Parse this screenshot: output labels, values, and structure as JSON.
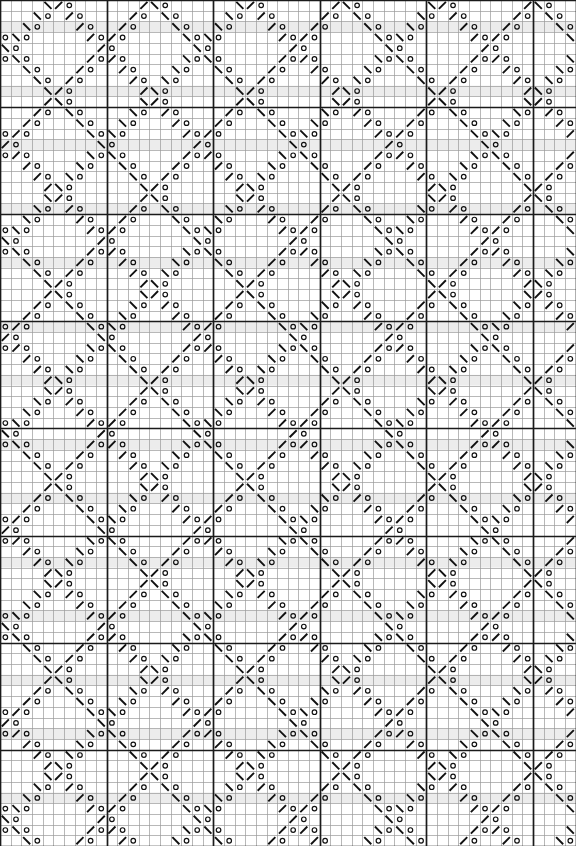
{
  "chart_meta": {
    "title": "Lace Knitting Chart",
    "kind": "knitting-lace-chart",
    "width_px": 576,
    "height_px": 846,
    "columns": 54,
    "rows": 79,
    "cell_w": 10.66,
    "cell_h": 10.71,
    "heavy_every": 10,
    "colors": {
      "background": "#ffffff",
      "grid_light": "#9a9a9a",
      "grid_heavy": "#1a1a1a",
      "symbol": "#101010",
      "shade_band": "#ececec"
    },
    "line_widths": {
      "light": 0.7,
      "heavy": 1.7,
      "symbol": 1.9
    }
  },
  "legend": {
    "title": "Symbols",
    "items": [
      {
        "key": "o",
        "symbol_name": "yarn-over-circle",
        "label": "yo (yarn over)"
      },
      {
        "key": "/",
        "symbol_name": "right-slant-decrease",
        "label": "k2tog (right slant)"
      },
      {
        "key": "\\",
        "symbol_name": "left-slant-decrease",
        "label": "ssk (left slant)"
      },
      {
        "key": "t",
        "symbol_name": "filled-triangle-marker",
        "label": "centered double decrease"
      },
      {
        "key": ".",
        "symbol_name": "blank-knit-cell",
        "label": "knit (blank)"
      }
    ]
  },
  "chart_data": {
    "type": "heatmap",
    "subtitle": "",
    "xlabel": "",
    "ylabel": "",
    "grid": true,
    "legend_position": "none",
    "categories": [],
    "values": [],
    "symbol_alphabet": [
      ".",
      "o",
      "/",
      "\\",
      "t"
    ],
    "cols": 54,
    "rows": 79,
    "motif": {
      "description": "Interlocking diagonal chevron lattice. Long continuous decrease diagonals run both NE-SW and NW-SE, crossing to form large diamonds; paired yarn-over circles flank every diagonal.",
      "diagonal_period_cols": 18,
      "diagonal_period_rows": 18,
      "chevron_apex_cols": [
        9,
        27,
        45
      ],
      "chevron_apex_rows": [
        4,
        22,
        40,
        58,
        76
      ]
    },
    "shade_band_rows": [
      2,
      8,
      13,
      19,
      24,
      30,
      35,
      41,
      46,
      52,
      57,
      63,
      68,
      74
    ],
    "heavy_col_lines": [
      0,
      10,
      20,
      30,
      40,
      50,
      54
    ],
    "heavy_row_lines": [
      0,
      10,
      20,
      30,
      40,
      50,
      60,
      70,
      79
    ]
  }
}
